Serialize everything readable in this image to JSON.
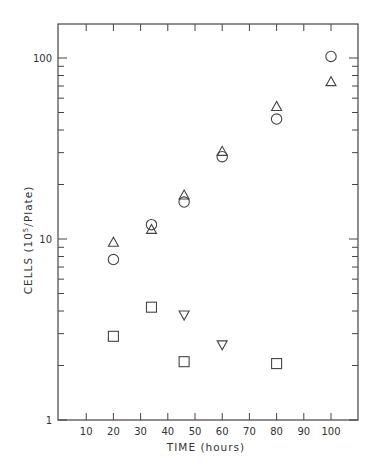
{
  "chart_data": {
    "type": "scatter",
    "title": "",
    "xlabel": "TIME (hours)",
    "ylabel": "CELLS  (10^5/Plate)",
    "ylabel_parts": {
      "main": "CELLS",
      "paren_open": "(10",
      "sup": "5",
      "paren_close": "/Plate)"
    },
    "xlim": [
      0,
      110
    ],
    "ylim": [
      1,
      200
    ],
    "yscale": "log",
    "grid": false,
    "legend": "none",
    "xticks": [
      10,
      20,
      30,
      40,
      50,
      60,
      70,
      80,
      90,
      100
    ],
    "xtick_labels": [
      "10",
      "20",
      "30",
      "40",
      "50",
      "60",
      "70",
      "80",
      "90",
      "100"
    ],
    "yticks_major": [
      1,
      10,
      100
    ],
    "ytick_labels": [
      "1",
      "10",
      "100"
    ],
    "series": [
      {
        "name": "circles",
        "marker": "circle",
        "x": [
          20,
          34,
          46,
          60,
          80,
          100
        ],
        "y": [
          7.7,
          12,
          16,
          28.5,
          46,
          102
        ]
      },
      {
        "name": "triangles-up",
        "marker": "triangle-up",
        "x": [
          20,
          34,
          46,
          60,
          80,
          100
        ],
        "y": [
          9.6,
          11.3,
          17.5,
          30.5,
          54,
          74
        ]
      },
      {
        "name": "squares",
        "marker": "square",
        "x": [
          20,
          34,
          46,
          80
        ],
        "y": [
          2.9,
          4.2,
          2.1,
          2.05
        ]
      },
      {
        "name": "triangles-down",
        "marker": "triangle-down",
        "x": [
          46,
          60
        ],
        "y": [
          3.8,
          2.6
        ]
      }
    ]
  }
}
